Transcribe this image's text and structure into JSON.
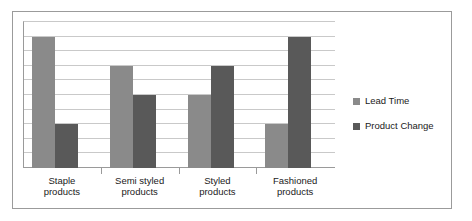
{
  "chart_data": {
    "type": "bar",
    "title": "",
    "xlabel": "",
    "ylabel": "",
    "ylim": [
      0,
      10
    ],
    "grid": true,
    "gridline_count": 10,
    "legend_position": "right",
    "categories": [
      "Staple products",
      "Semi styled products",
      "Styled products",
      "Fashioned products"
    ],
    "category_lines": [
      [
        "Staple",
        "products"
      ],
      [
        "Semi styled",
        "products"
      ],
      [
        "Styled",
        "products"
      ],
      [
        "Fashioned",
        "products"
      ]
    ],
    "series": [
      {
        "name": "Lead Time",
        "color": "#8a8a8a",
        "values": [
          9,
          7,
          5,
          3
        ]
      },
      {
        "name": "Product Change",
        "color": "#595959",
        "values": [
          3,
          5,
          7,
          9
        ]
      }
    ]
  },
  "legend": {
    "items": [
      {
        "label": "Lead Time",
        "color": "#8a8a8a"
      },
      {
        "label": "Product Change",
        "color": "#595959"
      }
    ]
  },
  "colors": {
    "series_a": "#8a8a8a",
    "series_b": "#595959",
    "gridline": "#c9c9c9",
    "axis": "#9a9a9a",
    "frame": "#9b9b9b",
    "text": "#1a1a1a",
    "background": "#ffffff"
  }
}
